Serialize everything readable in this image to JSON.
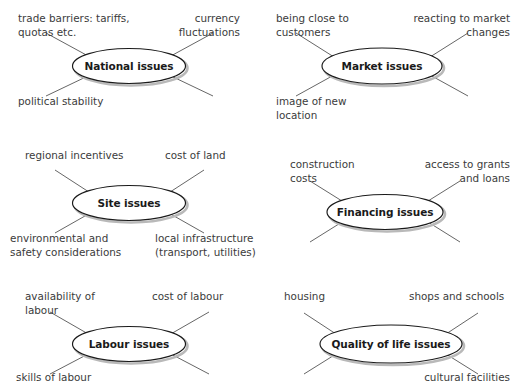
{
  "diagram": {
    "type": "spider-map-set",
    "background_color": "#ffffff",
    "node_fill": "#ffffff",
    "node_stroke": "#1a1a1a",
    "shadow_color": "#b9b9b9",
    "spoke_color": "#555555",
    "text_color": "#3b3b3b",
    "panels": [
      {
        "id": "national",
        "center_label": "National issues",
        "leaves": [
          {
            "id": "trade-barriers",
            "text": "trade barriers: tariffs,\nquotas etc.",
            "position": "top-left"
          },
          {
            "id": "currency-fluctuations",
            "text": "currency\nfluctuations",
            "position": "top-right"
          },
          {
            "id": "political-stability",
            "text": "political stability",
            "position": "bottom-left"
          }
        ]
      },
      {
        "id": "market",
        "center_label": "Market issues",
        "leaves": [
          {
            "id": "being-close-to-customers",
            "text": "being close to\ncustomers",
            "position": "top-left"
          },
          {
            "id": "reacting-to-market-changes",
            "text": "reacting to market\nchanges",
            "position": "top-right"
          },
          {
            "id": "image-of-new-location",
            "text": "image of new\nlocation",
            "position": "bottom-left"
          }
        ]
      },
      {
        "id": "site",
        "center_label": "Site issues",
        "leaves": [
          {
            "id": "regional-incentives",
            "text": "regional incentives",
            "position": "top-left"
          },
          {
            "id": "cost-of-land",
            "text": "cost of land",
            "position": "top-right"
          },
          {
            "id": "environmental-safety",
            "text": "environmental and\nsafety considerations",
            "position": "bottom-left"
          },
          {
            "id": "local-infrastructure",
            "text": "local infrastructure\n(transport, utilities)",
            "position": "bottom-right"
          }
        ]
      },
      {
        "id": "financing",
        "center_label": "Financing issues",
        "leaves": [
          {
            "id": "construction-costs",
            "text": "construction\ncosts",
            "position": "top-left"
          },
          {
            "id": "access-to-grants",
            "text": "access to grants\nand loans",
            "position": "top-right"
          }
        ]
      },
      {
        "id": "labour",
        "center_label": "Labour issues",
        "leaves": [
          {
            "id": "availability-of-labour",
            "text": "availability of\nlabour",
            "position": "top-left"
          },
          {
            "id": "cost-of-labour",
            "text": "cost of labour",
            "position": "top-right"
          },
          {
            "id": "skills-of-labour",
            "text": "skills of labour",
            "position": "bottom-left"
          }
        ]
      },
      {
        "id": "quality-of-life",
        "center_label": "Quality of life issues",
        "leaves": [
          {
            "id": "housing",
            "text": "housing",
            "position": "top-left"
          },
          {
            "id": "shops-and-schools",
            "text": "shops and schools",
            "position": "top-right"
          },
          {
            "id": "cultural-facilities",
            "text": "cultural facilities",
            "position": "bottom-right"
          }
        ]
      }
    ]
  }
}
